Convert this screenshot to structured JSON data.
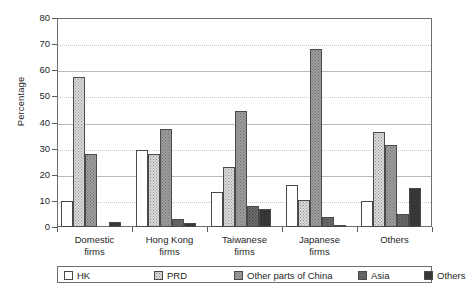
{
  "chart_data": {
    "type": "bar",
    "title": "",
    "xlabel": "",
    "ylabel": "Percentage",
    "ylim": [
      0,
      80
    ],
    "yticks": [
      0,
      10,
      20,
      30,
      40,
      50,
      60,
      70,
      80
    ],
    "grid": true,
    "legend_position": "bottom",
    "categories": [
      "Domestic firms",
      "Hong Kong firms",
      "Taiwanese firms",
      "Japanese firms",
      "Others"
    ],
    "category_lines": [
      [
        "Domestic",
        "firms"
      ],
      [
        "Hong Kong",
        "firms"
      ],
      [
        "Taiwanese",
        "firms"
      ],
      [
        "Japanese",
        "firms"
      ],
      [
        "Others",
        ""
      ]
    ],
    "series": [
      {
        "name": "HK",
        "color": "#ffffff",
        "values": [
          10.0,
          29.5,
          13.5,
          16.0,
          10.0
        ]
      },
      {
        "name": "PRD",
        "color": "#dcdcdc",
        "values": [
          57.5,
          28.0,
          23.0,
          10.5,
          36.5
        ]
      },
      {
        "name": "Other parts of China",
        "color": "#9e9e9e",
        "values": [
          28.0,
          37.5,
          44.5,
          68.0,
          31.5
        ]
      },
      {
        "name": "Asia",
        "color": "#6a6a6a",
        "values": [
          0.0,
          3.0,
          8.0,
          4.0,
          5.0
        ]
      },
      {
        "name": "Others",
        "color": "#3c3c3c",
        "values": [
          1.8,
          1.5,
          7.0,
          0.8,
          15.0
        ]
      }
    ]
  }
}
